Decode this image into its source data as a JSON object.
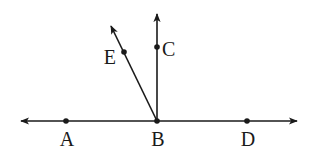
{
  "diagram": {
    "type": "geometry-rays",
    "stroke_color": "#1a1a1a",
    "background": "#ffffff",
    "line": {
      "name": "line-AD",
      "from": [
        21,
        121
      ],
      "to": [
        297,
        121
      ],
      "arrows": "both"
    },
    "rays": [
      {
        "name": "ray-BC",
        "from": [
          157,
          121
        ],
        "to": [
          157,
          14
        ]
      },
      {
        "name": "ray-BE",
        "from": [
          157,
          121
        ],
        "to": [
          111,
          26
        ]
      }
    ],
    "points": [
      {
        "id": "A",
        "label": "A",
        "x": 66,
        "y": 121,
        "lx": 67,
        "ly": 146,
        "anchor": "middle"
      },
      {
        "id": "B",
        "label": "B",
        "x": 157,
        "y": 121,
        "lx": 158,
        "ly": 146,
        "anchor": "middle"
      },
      {
        "id": "D",
        "label": "D",
        "x": 247,
        "y": 121,
        "lx": 248,
        "ly": 146,
        "anchor": "middle"
      },
      {
        "id": "C",
        "label": "C",
        "x": 157,
        "y": 47,
        "lx": 162,
        "ly": 56,
        "anchor": "start"
      },
      {
        "id": "E",
        "label": "E",
        "x": 124,
        "y": 52,
        "lx": 116,
        "ly": 64,
        "anchor": "end"
      }
    ]
  }
}
